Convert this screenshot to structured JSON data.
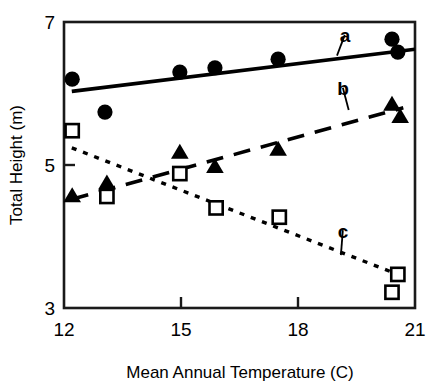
{
  "chart_data": {
    "type": "scatter",
    "title": "",
    "xlabel": "Mean Annual Temperature (C)",
    "ylabel": "Total Height (m)",
    "xlim": [
      12,
      21
    ],
    "ylim": [
      3,
      7
    ],
    "xticks": [
      12,
      15,
      18,
      21
    ],
    "yticks": [
      3,
      5,
      7
    ],
    "xtick_labels": [
      "12",
      "15",
      "18",
      "21"
    ],
    "ytick_labels": [
      "3",
      "5",
      "7"
    ],
    "grid": false,
    "legend_position": "inline-annotations",
    "annotations": [
      {
        "text": "a",
        "x": 19.2,
        "y": 6.82,
        "leader_to_x": 19.0,
        "leader_to_y": 6.53
      },
      {
        "text": "b",
        "x": 19.15,
        "y": 6.08,
        "leader_to_x": 19.3,
        "leader_to_y": 5.77
      },
      {
        "text": "c",
        "x": 19.15,
        "y": 4.09,
        "leader_to_x": 19.1,
        "leader_to_y": 3.74
      }
    ],
    "series": [
      {
        "name": "a",
        "label": "a",
        "marker": "filled-circle",
        "line_style": "solid",
        "color": "#000000",
        "points": [
          {
            "x": 12.21,
            "y": 6.2
          },
          {
            "x": 13.05,
            "y": 5.74
          },
          {
            "x": 14.97,
            "y": 6.3
          },
          {
            "x": 15.87,
            "y": 6.36
          },
          {
            "x": 17.49,
            "y": 6.48
          },
          {
            "x": 20.41,
            "y": 6.76
          },
          {
            "x": 20.56,
            "y": 6.58
          }
        ],
        "fit_line": {
          "x1": 12.2,
          "y1": 6.03,
          "x2": 21.0,
          "y2": 6.62
        }
      },
      {
        "name": "b",
        "label": "b",
        "marker": "filled-triangle",
        "line_style": "dashed",
        "color": "#000000",
        "points": [
          {
            "x": 12.21,
            "y": 4.57
          },
          {
            "x": 13.1,
            "y": 4.75
          },
          {
            "x": 14.97,
            "y": 5.18
          },
          {
            "x": 15.87,
            "y": 4.98
          },
          {
            "x": 17.49,
            "y": 5.22
          },
          {
            "x": 20.41,
            "y": 5.85
          },
          {
            "x": 20.62,
            "y": 5.68
          }
        ],
        "fit_line": {
          "x1": 12.2,
          "y1": 4.52,
          "x2": 20.7,
          "y2": 5.8
        }
      },
      {
        "name": "c",
        "label": "c",
        "marker": "open-square",
        "line_style": "dotted",
        "color": "#000000",
        "points": [
          {
            "x": 12.21,
            "y": 5.48
          },
          {
            "x": 13.1,
            "y": 4.56
          },
          {
            "x": 14.97,
            "y": 4.88
          },
          {
            "x": 15.9,
            "y": 4.4
          },
          {
            "x": 17.52,
            "y": 4.27
          },
          {
            "x": 20.56,
            "y": 3.47
          },
          {
            "x": 20.41,
            "y": 3.22
          }
        ],
        "fit_line": {
          "x1": 12.2,
          "y1": 5.24,
          "x2": 20.75,
          "y2": 3.43
        }
      }
    ]
  }
}
